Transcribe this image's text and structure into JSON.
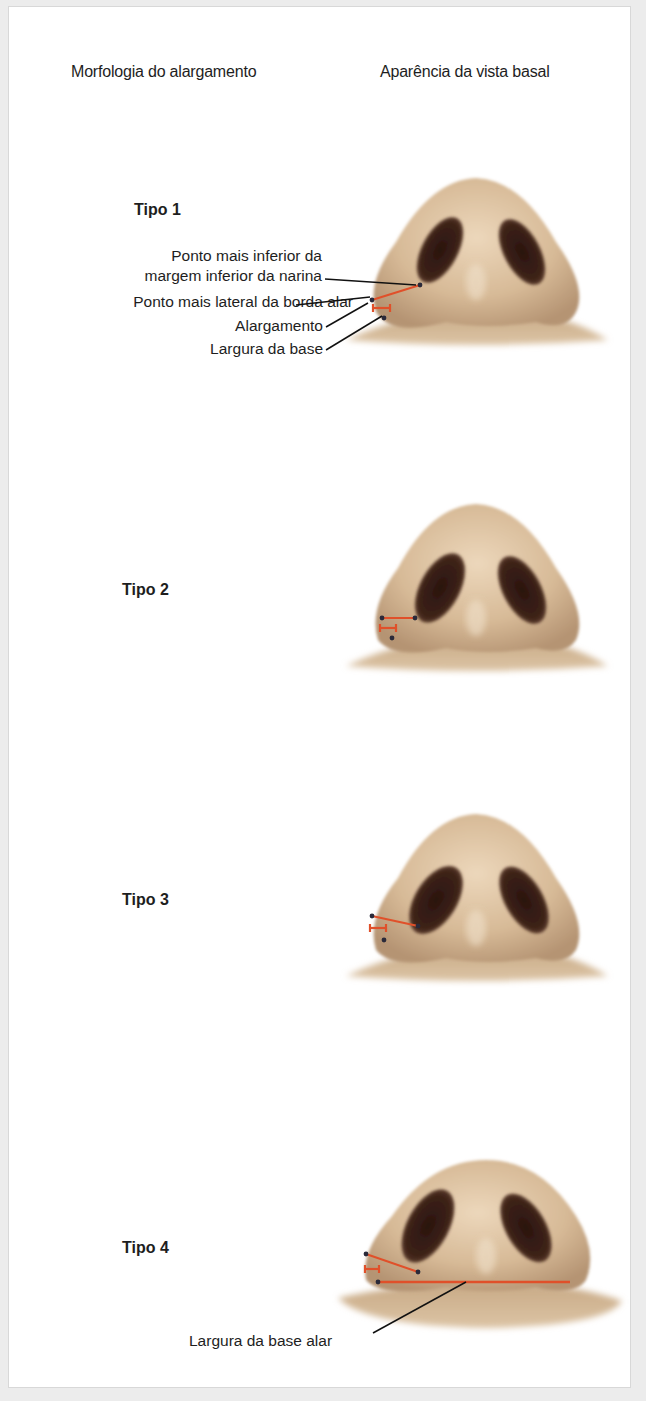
{
  "header": {
    "left_title": "Morfologia do alargamento",
    "right_title": "Aparência da vista basal"
  },
  "types": [
    {
      "label": "Tipo 1"
    },
    {
      "label": "Tipo 2"
    },
    {
      "label": "Tipo 3"
    },
    {
      "label": "Tipo 4"
    }
  ],
  "annotations": {
    "nostril_lowest_point": "Ponto mais inferior da\nmargem inferior  da narina",
    "nostril_lowest_point_line1": "Ponto mais inferior da",
    "nostril_lowest_point_line2": "margem inferior  da narina",
    "alar_rim_lateral_point": "Ponto mais lateral da borda alar",
    "flaring": "Alargamento",
    "base_width": "Largura da base",
    "alar_base_width": "Largura da base alar"
  },
  "colors": {
    "skin": "#d9bd9c",
    "skin_shadow": "#b89a78",
    "nostril": "#3a2018",
    "measure_line": "#e0502a",
    "landmark_dot": "#2a2a3a",
    "leader_line": "#111111"
  }
}
